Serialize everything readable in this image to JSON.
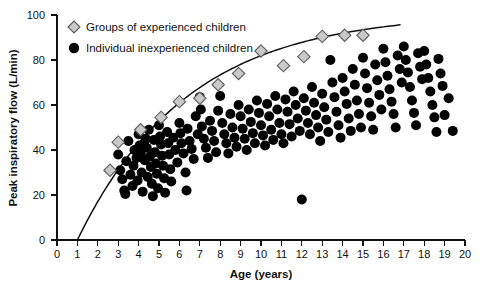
{
  "chart_data": {
    "type": "scatter",
    "title": "",
    "xlabel": "Age (years)",
    "ylabel": "Peak inspiratory flow (L/min)",
    "xlim": [
      0,
      20
    ],
    "ylim": [
      0,
      100
    ],
    "xticks": [
      0,
      1,
      2,
      3,
      4,
      5,
      6,
      7,
      8,
      9,
      10,
      11,
      12,
      13,
      14,
      15,
      16,
      17,
      18,
      19,
      20
    ],
    "yticks": [
      0,
      20,
      40,
      60,
      80,
      100
    ],
    "grid": false,
    "legend_position": "top-left",
    "legend": [
      {
        "key": "groups",
        "label": "Groups of experienced children",
        "marker": "diamond",
        "color": "#c9c9c9",
        "edge": "#5d5d5d"
      },
      {
        "key": "individuals",
        "label": "Individual inexperienced children",
        "marker": "circle",
        "color": "#000000",
        "edge": "#000000"
      }
    ],
    "series": [
      {
        "name": "Groups of experienced children",
        "marker": "diamond",
        "points": [
          [
            2.6,
            31.0
          ],
          [
            3.0,
            43.5
          ],
          [
            4.1,
            49.0
          ],
          [
            5.1,
            54.5
          ],
          [
            6.0,
            61.5
          ],
          [
            7.0,
            63.0
          ],
          [
            7.9,
            69.0
          ],
          [
            8.9,
            74.0
          ],
          [
            10.0,
            84.0
          ],
          [
            11.1,
            77.5
          ],
          [
            12.1,
            81.5
          ],
          [
            13.0,
            90.5
          ],
          [
            14.1,
            91.0
          ],
          [
            15.0,
            91.0
          ]
        ]
      },
      {
        "name": "Individual inexperienced children",
        "marker": "circle",
        "points": [
          [
            3.0,
            38.0
          ],
          [
            3.1,
            31.0
          ],
          [
            3.2,
            27.0
          ],
          [
            3.3,
            22.0
          ],
          [
            3.35,
            20.5
          ],
          [
            3.4,
            35.0
          ],
          [
            3.5,
            44.0
          ],
          [
            3.6,
            29.0
          ],
          [
            3.7,
            24.0
          ],
          [
            3.75,
            33.0
          ],
          [
            3.8,
            40.0
          ],
          [
            3.9,
            36.5
          ],
          [
            3.95,
            26.5
          ],
          [
            4.0,
            47.0
          ],
          [
            4.05,
            42.0
          ],
          [
            4.1,
            38.5
          ],
          [
            4.15,
            30.0
          ],
          [
            4.2,
            21.5
          ],
          [
            4.3,
            35.5
          ],
          [
            4.35,
            45.0
          ],
          [
            4.4,
            41.0
          ],
          [
            4.45,
            28.0
          ],
          [
            4.5,
            49.0
          ],
          [
            4.55,
            37.0
          ],
          [
            4.6,
            32.5
          ],
          [
            4.65,
            25.0
          ],
          [
            4.7,
            19.5
          ],
          [
            4.75,
            44.5
          ],
          [
            4.8,
            39.0
          ],
          [
            4.85,
            34.0
          ],
          [
            4.9,
            29.5
          ],
          [
            4.95,
            23.0
          ],
          [
            5.0,
            51.0
          ],
          [
            5.05,
            46.0
          ],
          [
            5.1,
            42.5
          ],
          [
            5.15,
            37.5
          ],
          [
            5.2,
            33.0
          ],
          [
            5.25,
            27.5
          ],
          [
            5.3,
            21.0
          ],
          [
            5.4,
            48.0
          ],
          [
            5.45,
            43.0
          ],
          [
            5.5,
            38.0
          ],
          [
            5.55,
            31.5
          ],
          [
            5.6,
            26.0
          ],
          [
            5.7,
            45.5
          ],
          [
            5.8,
            40.0
          ],
          [
            5.9,
            34.5
          ],
          [
            6.0,
            52.0
          ],
          [
            6.05,
            47.5
          ],
          [
            6.1,
            43.0
          ],
          [
            6.2,
            38.5
          ],
          [
            6.3,
            30.0
          ],
          [
            6.35,
            22.0
          ],
          [
            6.4,
            49.5
          ],
          [
            6.5,
            44.0
          ],
          [
            6.6,
            40.5
          ],
          [
            6.7,
            36.0
          ],
          [
            6.8,
            55.0
          ],
          [
            6.9,
            47.0
          ],
          [
            7.0,
            63.5
          ],
          [
            7.05,
            58.0
          ],
          [
            7.1,
            50.5
          ],
          [
            7.2,
            45.0
          ],
          [
            7.3,
            41.0
          ],
          [
            7.4,
            36.5
          ],
          [
            7.5,
            53.0
          ],
          [
            7.6,
            48.5
          ],
          [
            7.7,
            44.0
          ],
          [
            7.8,
            39.0
          ],
          [
            7.9,
            57.5
          ],
          [
            8.0,
            64.0
          ],
          [
            8.1,
            52.0
          ],
          [
            8.2,
            47.0
          ],
          [
            8.3,
            43.0
          ],
          [
            8.4,
            38.5
          ],
          [
            8.5,
            56.0
          ],
          [
            8.6,
            50.0
          ],
          [
            8.7,
            45.5
          ],
          [
            8.8,
            41.5
          ],
          [
            8.9,
            60.0
          ],
          [
            9.0,
            55.0
          ],
          [
            9.1,
            49.5
          ],
          [
            9.2,
            45.0
          ],
          [
            9.3,
            40.0
          ],
          [
            9.4,
            58.0
          ],
          [
            9.5,
            52.5
          ],
          [
            9.6,
            47.5
          ],
          [
            9.7,
            43.0
          ],
          [
            9.8,
            62.0
          ],
          [
            9.9,
            56.5
          ],
          [
            10.0,
            51.0
          ],
          [
            10.1,
            46.5
          ],
          [
            10.2,
            42.0
          ],
          [
            10.3,
            60.5
          ],
          [
            10.4,
            55.0
          ],
          [
            10.5,
            49.0
          ],
          [
            10.6,
            44.5
          ],
          [
            10.7,
            64.0
          ],
          [
            10.8,
            58.0
          ],
          [
            10.9,
            52.0
          ],
          [
            11.0,
            47.0
          ],
          [
            11.1,
            43.0
          ],
          [
            11.2,
            62.5
          ],
          [
            11.3,
            57.0
          ],
          [
            11.4,
            51.5
          ],
          [
            11.5,
            46.0
          ],
          [
            11.6,
            66.0
          ],
          [
            11.7,
            60.0
          ],
          [
            11.8,
            54.0
          ],
          [
            11.9,
            48.5
          ],
          [
            12.0,
            18.0
          ],
          [
            12.1,
            63.0
          ],
          [
            12.2,
            57.5
          ],
          [
            12.3,
            52.0
          ],
          [
            12.4,
            47.0
          ],
          [
            12.5,
            68.0
          ],
          [
            12.6,
            61.0
          ],
          [
            12.7,
            55.5
          ],
          [
            12.8,
            50.0
          ],
          [
            12.9,
            44.0
          ],
          [
            13.0,
            65.0
          ],
          [
            13.1,
            59.0
          ],
          [
            13.2,
            53.5
          ],
          [
            13.3,
            48.0
          ],
          [
            13.4,
            80.0
          ],
          [
            13.5,
            70.0
          ],
          [
            13.6,
            63.5
          ],
          [
            13.7,
            57.0
          ],
          [
            13.8,
            51.0
          ],
          [
            13.9,
            45.5
          ],
          [
            14.0,
            72.0
          ],
          [
            14.1,
            66.0
          ],
          [
            14.2,
            60.5
          ],
          [
            14.3,
            54.0
          ],
          [
            14.4,
            48.5
          ],
          [
            14.5,
            76.0
          ],
          [
            14.6,
            69.0
          ],
          [
            14.7,
            62.0
          ],
          [
            14.8,
            56.0
          ],
          [
            14.9,
            50.0
          ],
          [
            15.0,
            81.0
          ],
          [
            15.1,
            74.0
          ],
          [
            15.2,
            67.5
          ],
          [
            15.3,
            61.0
          ],
          [
            15.4,
            55.0
          ],
          [
            15.5,
            49.0
          ],
          [
            15.6,
            78.0
          ],
          [
            15.7,
            71.0
          ],
          [
            15.8,
            64.5
          ],
          [
            15.9,
            58.0
          ],
          [
            16.0,
            85.0
          ],
          [
            16.1,
            79.0
          ],
          [
            16.2,
            73.0
          ],
          [
            16.3,
            67.0
          ],
          [
            16.4,
            61.5
          ],
          [
            16.5,
            56.0
          ],
          [
            16.6,
            50.0
          ],
          [
            16.7,
            82.0
          ],
          [
            16.8,
            76.0
          ],
          [
            16.9,
            70.0
          ],
          [
            17.0,
            86.0
          ],
          [
            17.1,
            80.0
          ],
          [
            17.2,
            74.5
          ],
          [
            17.3,
            68.0
          ],
          [
            17.4,
            62.0
          ],
          [
            17.5,
            56.5
          ],
          [
            17.6,
            51.0
          ],
          [
            17.7,
            83.0
          ],
          [
            17.8,
            77.0
          ],
          [
            17.9,
            71.5
          ],
          [
            18.0,
            84.0
          ],
          [
            18.1,
            78.0
          ],
          [
            18.2,
            72.0
          ],
          [
            18.3,
            66.0
          ],
          [
            18.4,
            60.0
          ],
          [
            18.5,
            54.5
          ],
          [
            18.6,
            48.0
          ],
          [
            18.7,
            80.5
          ],
          [
            18.8,
            74.0
          ],
          [
            18.9,
            68.5
          ],
          [
            19.0,
            55.5
          ],
          [
            19.2,
            63.0
          ],
          [
            19.4,
            48.5
          ]
        ]
      }
    ],
    "annotations": [
      {
        "name": "fitted-growth-curve",
        "type": "curve",
        "description": "Upper-boundary growth curve rising from age 1 at 0 L/min to about age 16.8 at 98 L/min"
      }
    ]
  }
}
